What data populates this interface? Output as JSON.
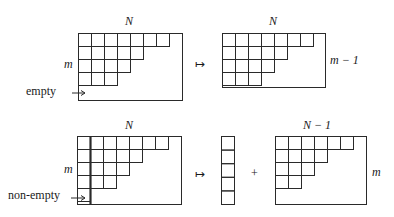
{
  "diagram": {
    "cell_size": 13,
    "line_color": "#2a2a2a",
    "top_row": {
      "left": {
        "top_label": "N",
        "side_label": "m",
        "arrow_label": "empty",
        "rows": [
          7,
          5,
          4,
          3,
          0
        ],
        "width_cells": 8
      },
      "maps_to": "↦",
      "right": {
        "top_label": "N",
        "side_label": "m − 1",
        "rows": [
          7,
          5,
          4,
          3
        ],
        "width_cells": 8
      }
    },
    "bottom_row": {
      "left": {
        "top_label": "N",
        "side_label": "m",
        "arrow_label": "non-empty",
        "rows": [
          7,
          5,
          4,
          3,
          1
        ],
        "width_cells": 8,
        "highlight_first_column": true
      },
      "maps_to": "↦",
      "column": {
        "cells": 5
      },
      "plus": "+",
      "right": {
        "top_label": "N − 1",
        "side_label": "m",
        "rows": [
          6,
          4,
          3,
          2,
          0
        ],
        "width_cells": 7
      }
    }
  }
}
